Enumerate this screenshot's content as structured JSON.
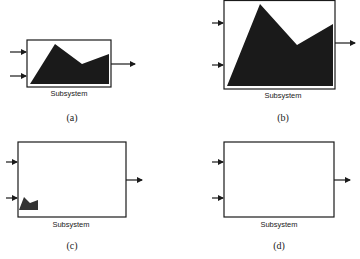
{
  "panels": [
    {
      "id": "a",
      "block_label": "Subsystem",
      "caption": "(a)",
      "icon_state": "normal"
    },
    {
      "id": "b",
      "block_label": "Subsystem",
      "caption": "(b)",
      "icon_state": "scaled-to-fill"
    },
    {
      "id": "c",
      "block_label": "Subsystem",
      "caption": "(c)",
      "icon_state": "fixed-size-small"
    },
    {
      "id": "d",
      "block_label": "Subsystem",
      "caption": "(d)",
      "icon_state": "hidden"
    }
  ],
  "colors": {
    "shape_fill": "#1a1a1a",
    "border": "#1a1a1a",
    "background": "#ffffff"
  }
}
